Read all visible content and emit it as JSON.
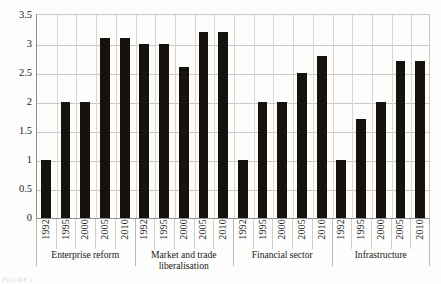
{
  "chart_data": {
    "type": "bar",
    "title": "",
    "xlabel": "",
    "ylabel": "",
    "ylim": [
      0,
      3.5
    ],
    "ytick_step": 0.5,
    "yticks": [
      "0",
      "0.5",
      "1",
      "1.5",
      "2",
      "2.5",
      "3",
      "3.5"
    ],
    "grid": true,
    "legend": "none",
    "bar_color": "#17120e",
    "categories": [
      "1992",
      "1995",
      "2000",
      "2005",
      "2010"
    ],
    "groups": [
      {
        "label": "Enterprise reform",
        "categories": [
          "1992",
          "1995",
          "2000",
          "2005",
          "2010"
        ],
        "values": [
          1.0,
          2.0,
          2.0,
          3.1,
          3.1
        ]
      },
      {
        "label": "Market and trade liberalisation",
        "categories": [
          "1992",
          "1995",
          "2000",
          "2005",
          "2010"
        ],
        "values": [
          3.0,
          3.0,
          2.6,
          3.2,
          3.2
        ]
      },
      {
        "label": "Financial sector",
        "categories": [
          "1992",
          "1995",
          "2000",
          "2005",
          "2010"
        ],
        "values": [
          1.0,
          2.0,
          2.0,
          2.5,
          2.8
        ]
      },
      {
        "label": "Infrastructure",
        "categories": [
          "1992",
          "1995",
          "2000",
          "2005",
          "2010"
        ],
        "values": [
          1.0,
          1.7,
          2.0,
          2.7,
          2.7
        ]
      }
    ]
  },
  "caption": "FIGURE 1"
}
